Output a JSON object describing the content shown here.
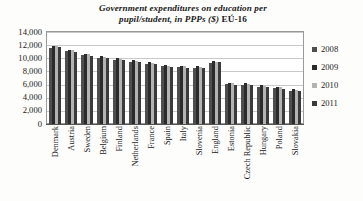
{
  "chart_data": {
    "type": "bar",
    "title": "Government expenditures on education per pupil/student, in PPPs ($)  EÚ-16",
    "title_line1": "Government expenditures on education per",
    "title_line2": "pupil/student, in PPPs ($)",
    "title_suffix": "EÚ-16",
    "xlabel": "",
    "ylabel": "",
    "ylim": [
      0,
      14000
    ],
    "ytick_labels": [
      "14,000",
      "12,000",
      "10,000",
      "8,000",
      "6,000",
      "4,000",
      "2,000",
      "0"
    ],
    "ytick_values": [
      14000,
      12000,
      10000,
      8000,
      6000,
      4000,
      2000,
      0
    ],
    "grid": true,
    "legend_position": "right",
    "categories": [
      "Denmark",
      "Austria",
      "Sweden",
      "Belgium",
      "Finland",
      "Netherlands",
      "France",
      "Spain",
      "Italy",
      "Slovenia",
      "England",
      "Estonia",
      "Czech Republic",
      "Hungary",
      "Poland",
      "Slovakia"
    ],
    "series": [
      {
        "name": "2008",
        "color": "#4e4e4e",
        "values": [
          11600,
          11100,
          10500,
          10100,
          9700,
          9500,
          9200,
          8800,
          8700,
          8600,
          9300,
          6100,
          6000,
          5700,
          5500,
          5100
        ]
      },
      {
        "name": "2009",
        "color": "#2b2b2b",
        "values": [
          11900,
          11300,
          10700,
          10300,
          10000,
          9700,
          9400,
          9000,
          8900,
          8800,
          9600,
          6300,
          6200,
          5900,
          5700,
          5300
        ]
      },
      {
        "name": "2010",
        "color": "#b3b3b3",
        "values": [
          11800,
          11200,
          10600,
          10200,
          9900,
          9600,
          9300,
          8900,
          8800,
          8700,
          9500,
          6200,
          6100,
          5800,
          5600,
          5200
        ]
      },
      {
        "name": "2011",
        "color": "#3a3a3a",
        "values": [
          11700,
          11000,
          10400,
          10000,
          9800,
          9400,
          9100,
          8700,
          8600,
          8500,
          9400,
          6000,
          5900,
          5600,
          5400,
          5000
        ]
      }
    ],
    "legend": [
      "2008",
      "2009",
      "2010",
      "2011"
    ]
  }
}
